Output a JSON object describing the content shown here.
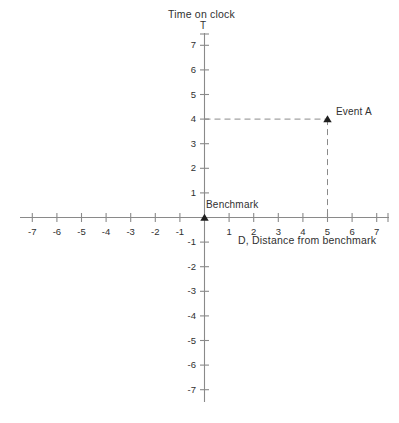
{
  "figure": {
    "background_color": "#ffffff",
    "line_color": "#8a8a8a",
    "text_color": "#303030"
  },
  "axes": {
    "y_axis_title": "Time on clock",
    "y_axis_symbol": "T",
    "x_axis_title": "D, Distance from benchmark",
    "x_axis_symbol": "D"
  },
  "annotations": {
    "origin_label": "Benchmark",
    "event_label": "Event A"
  },
  "chart_data": {
    "type": "scatter",
    "title": "Time on clock",
    "xlabel": "D, Distance from benchmark",
    "ylabel": "Time on clock",
    "xlim": [
      -7.5,
      7.5
    ],
    "ylim": [
      -7.5,
      7.5
    ],
    "grid": false,
    "legend": "none",
    "x_ticks": [
      -7,
      -6,
      -5,
      -4,
      -3,
      -2,
      -1,
      1,
      2,
      3,
      4,
      5,
      6,
      7
    ],
    "x_tick_labels": [
      "-7",
      "-6",
      "-5",
      "-4",
      "-3",
      "-2",
      "-1",
      "1",
      "2",
      "3",
      "4",
      "5",
      "6",
      "7"
    ],
    "y_ticks": [
      -7,
      -6,
      -5,
      -4,
      -3,
      -2,
      -1,
      1,
      2,
      3,
      4,
      5,
      6,
      7
    ],
    "y_tick_labels": [
      "-7",
      "-6",
      "-5",
      "-4",
      "-3",
      "-2",
      "-1",
      "1",
      "2",
      "3",
      "4",
      "5",
      "6",
      "7"
    ],
    "points": [
      {
        "name": "Benchmark",
        "x": 0,
        "y": 0,
        "marker": "triangle-up",
        "label": "Benchmark"
      },
      {
        "name": "Event A",
        "x": 5,
        "y": 4,
        "marker": "triangle-up",
        "label": "Event A"
      }
    ],
    "guide_lines": [
      {
        "name": "horizontal-guide",
        "from": [
          0,
          4
        ],
        "to": [
          5,
          4
        ],
        "style": "dashed"
      },
      {
        "name": "vertical-guide",
        "from": [
          5,
          4
        ],
        "to": [
          5,
          0
        ],
        "style": "dashed"
      }
    ]
  }
}
